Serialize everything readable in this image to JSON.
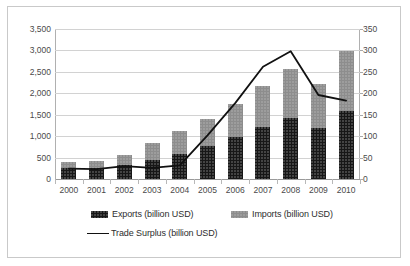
{
  "chart_data": {
    "type": "bar",
    "title": "",
    "subtitle": "",
    "xlabel": "",
    "ylabel": "",
    "y2label": "",
    "categories": [
      "2000",
      "2001",
      "2002",
      "2003",
      "2004",
      "2005",
      "2006",
      "2007",
      "2008",
      "2009",
      "2010"
    ],
    "series": [
      {
        "name": "Exports (billion USD)",
        "type": "bar",
        "stack": "trade",
        "axis": "left",
        "color": "#171717",
        "values": [
          249,
          266,
          326,
          438,
          593,
          762,
          969,
          1220,
          1430,
          1202,
          1578
        ]
      },
      {
        "name": "Imports (billion USD)",
        "type": "bar",
        "stack": "trade",
        "axis": "left",
        "color": "#8d8d8d",
        "values": [
          151,
          164,
          244,
          392,
          527,
          638,
          771,
          950,
          1133,
          1006,
          1417
        ]
      },
      {
        "name": "Trade Surplus (billion USD)",
        "type": "line",
        "axis": "right",
        "color": "#111111",
        "values": [
          24,
          23,
          30,
          26,
          32,
          102,
          177,
          262,
          298,
          196,
          183
        ]
      }
    ],
    "left_axis": {
      "min": 0,
      "max": 3500,
      "step": 500,
      "ticks": [
        "0",
        "500",
        "1,000",
        "1,500",
        "2,000",
        "2,500",
        "3,000",
        "3,500"
      ]
    },
    "right_axis": {
      "min": 0,
      "max": 350,
      "step": 50,
      "ticks": [
        "0",
        "50",
        "100",
        "150",
        "200",
        "250",
        "300",
        "350"
      ]
    },
    "grid": true,
    "legend_position": "bottom"
  },
  "legend": {
    "exports_label": "Exports (billion USD)",
    "imports_label": "Imports (billion USD)",
    "surplus_label": "Trade Surplus (billion USD)"
  }
}
